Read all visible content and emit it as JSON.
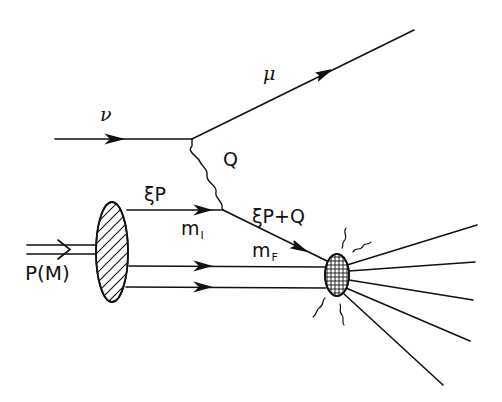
{
  "diagram": {
    "type": "feynman-diagram",
    "colors": {
      "ink": "#111111",
      "background": "#ffffff"
    },
    "labels": {
      "neutrino": "ν",
      "muon": "μ",
      "boson_momentum": "Q",
      "parton_initial": "ξP",
      "parton_final": "ξP+Q",
      "mass_initial": "m",
      "mass_initial_sub": "I",
      "mass_final": "m",
      "mass_final_sub": "F",
      "proton": "P(M)"
    },
    "nodes": [
      {
        "id": "lepton-vertex",
        "x": 192,
        "y": 139
      },
      {
        "id": "parton-vertex",
        "x": 223,
        "y": 210
      },
      {
        "id": "target-blob",
        "x": 112,
        "y": 252,
        "shape": "hatched-ellipse"
      },
      {
        "id": "hadronization-blob",
        "x": 337,
        "y": 275,
        "shape": "crosshatched-ellipse"
      }
    ],
    "edges": [
      {
        "from": "incoming",
        "to": "lepton-vertex",
        "label": "ν",
        "style": "fermion"
      },
      {
        "from": "lepton-vertex",
        "to": "outgoing",
        "label": "μ",
        "style": "fermion"
      },
      {
        "from": "lepton-vertex",
        "to": "parton-vertex",
        "label": "Q",
        "style": "wavy"
      },
      {
        "from": "target-blob",
        "to": "parton-vertex",
        "label": "ξP",
        "style": "fermion"
      },
      {
        "from": "parton-vertex",
        "to": "hadronization-blob",
        "label": "ξP+Q",
        "style": "fermion"
      },
      {
        "from": "target-blob",
        "to": "hadronization-blob",
        "label": "spectator-1",
        "style": "fermion"
      },
      {
        "from": "target-blob",
        "to": "hadronization-blob",
        "label": "spectator-2",
        "style": "fermion"
      },
      {
        "from": "incoming-proton",
        "to": "target-blob",
        "label": "P(M)",
        "style": "double-line"
      }
    ],
    "outgoing_jets": 5
  }
}
